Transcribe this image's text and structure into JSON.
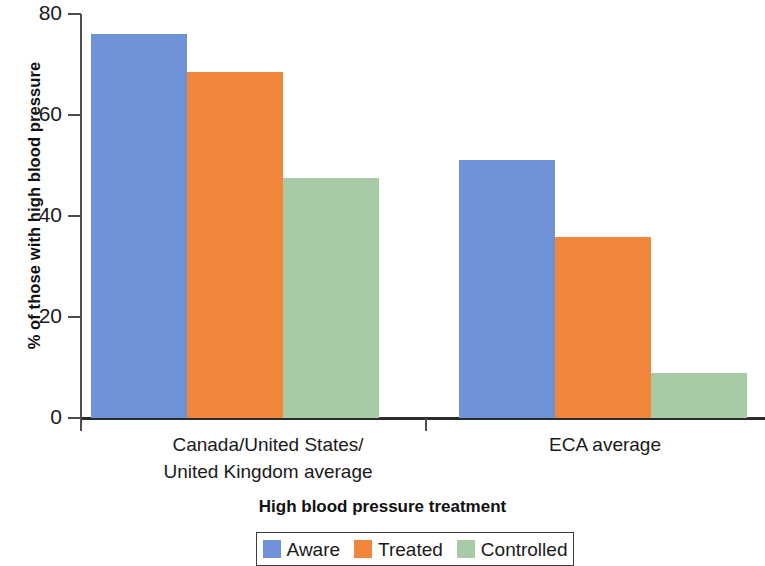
{
  "chart_data": {
    "type": "bar",
    "title": "",
    "xlabel": "High blood pressure treatment",
    "ylabel": "% of those with high blood pressure",
    "categories": [
      "Canada/United States/\nUnited Kingdom average",
      "ECA average"
    ],
    "category_lines": [
      [
        "Canada/United States/",
        "United Kingdom average"
      ],
      [
        "ECA average"
      ]
    ],
    "series": [
      {
        "name": "Aware",
        "color": "#6f92d6",
        "values": [
          76,
          51
        ]
      },
      {
        "name": "Treated",
        "color": "#f2863c",
        "values": [
          68.5,
          35.8
        ]
      },
      {
        "name": "Controlled",
        "color": "#a9caa6",
        "values": [
          47.5,
          9
        ]
      }
    ],
    "ylim": [
      0,
      80
    ],
    "yticks": [
      0,
      20,
      40,
      60,
      80
    ],
    "ytick_labels": [
      "0",
      "20",
      "40",
      "60",
      "80"
    ],
    "grid": false,
    "legend_position": "bottom"
  },
  "axis": {
    "y_title": "% of those with high blood pressure",
    "x_title": "High blood pressure treatment",
    "ticks": [
      {
        "label": "80",
        "value": 80
      },
      {
        "label": "60",
        "value": 60
      },
      {
        "label": "40",
        "value": 40
      },
      {
        "label": "20",
        "value": 20
      },
      {
        "label": "0",
        "value": 0
      }
    ]
  },
  "categories": [
    {
      "line1": "Canada/United States/",
      "line2": "United Kingdom average"
    },
    {
      "line1": "ECA average",
      "line2": ""
    }
  ],
  "legend": {
    "items": [
      {
        "label": "Aware",
        "color": "#6f92d6"
      },
      {
        "label": "Treated",
        "color": "#f2863c"
      },
      {
        "label": "Controlled",
        "color": "#a9caa6"
      }
    ]
  }
}
